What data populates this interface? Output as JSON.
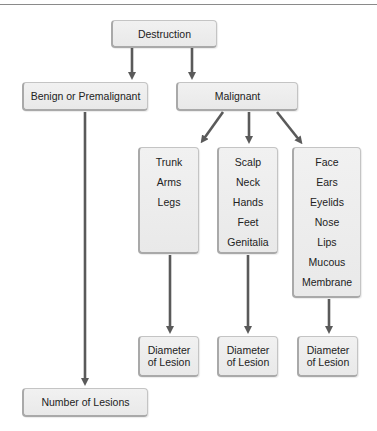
{
  "diagram": {
    "root": "Destruction",
    "benign": "Benign or Premalignant",
    "malignant": "Malignant",
    "columns": [
      {
        "items": [
          "Trunk",
          "Arms",
          "Legs"
        ],
        "result": [
          "Diameter",
          "of Lesion"
        ]
      },
      {
        "items": [
          "Scalp",
          "Neck",
          "Hands",
          "Feet",
          "Genitalia"
        ],
        "result": [
          "Diameter",
          "of Lesion"
        ]
      },
      {
        "items": [
          "Face",
          "Ears",
          "Eyelids",
          "Nose",
          "Lips"
        ],
        "multiline_item": [
          "Mucous",
          "Membrane"
        ],
        "result": [
          "Diameter",
          "of Lesion"
        ]
      }
    ],
    "benign_result": "Number of Lesions"
  },
  "colors": {
    "arrow": "#5a5a5a",
    "box_fill": "#eeeeee",
    "box_border": "#a9a9a9"
  }
}
